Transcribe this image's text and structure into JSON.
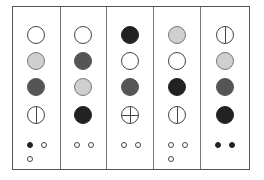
{
  "diagram": {
    "colors": {
      "white": "#ffffff",
      "light": "#cfcfcf",
      "mid": "#555555",
      "dark": "#222222",
      "line": "#444444"
    },
    "columns": [
      {
        "circles": [
          "white",
          "light",
          "mid",
          "white-vline"
        ],
        "dots": [
          "filled",
          "open",
          "open"
        ]
      },
      {
        "circles": [
          "white",
          "mid",
          "light",
          "dark"
        ],
        "dots": [
          "open",
          "open"
        ]
      },
      {
        "circles": [
          "dark",
          "white",
          "mid",
          "white-cross"
        ],
        "dots": [
          "open",
          "open"
        ]
      },
      {
        "circles": [
          "light",
          "white",
          "dark",
          "white-vline"
        ],
        "dots": [
          "open",
          "open",
          "open"
        ]
      },
      {
        "circles": [
          "white-vline",
          "light",
          "mid",
          "dark"
        ],
        "dots": [
          "filled",
          "filled"
        ]
      }
    ]
  }
}
